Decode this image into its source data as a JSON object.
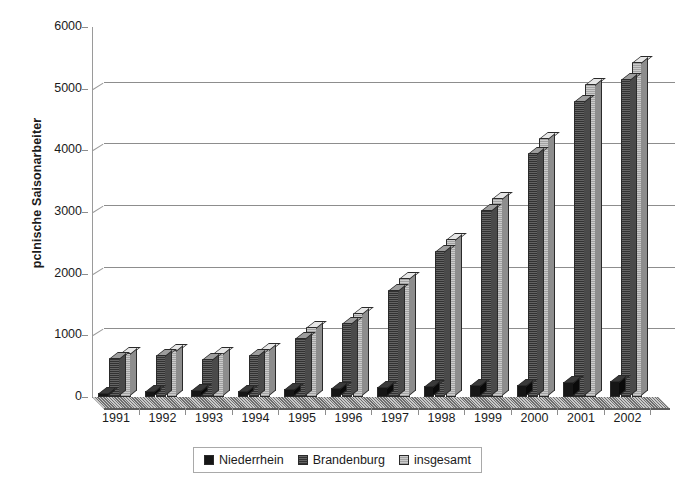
{
  "chart_data": {
    "type": "bar",
    "title": "",
    "xlabel": "",
    "ylabel": "pclnische Saisonarbeiter",
    "ylim": [
      0,
      6000
    ],
    "ytick_labels": [
      "6000",
      "5000",
      "4000",
      "3000",
      "2000",
      "1000",
      "0"
    ],
    "ytick_values": [
      6000,
      5000,
      4000,
      3000,
      2000,
      1000,
      0
    ],
    "grid": true,
    "legend_position": "bottom",
    "categories": [
      "1991",
      "1992",
      "1993",
      "1994",
      "1995",
      "1996",
      "1997",
      "1998",
      "1999",
      "2000",
      "2001",
      "2002"
    ],
    "series": [
      {
        "name": "Niederrhein",
        "color": "#161616",
        "values": [
          70,
          90,
          110,
          100,
          130,
          140,
          160,
          180,
          190,
          200,
          240,
          260
        ]
      },
      {
        "name": "Brandenburg",
        "color": "#8a8a8a",
        "values": [
          640,
          680,
          610,
          680,
          960,
          1200,
          1740,
          2370,
          3030,
          3950,
          4800,
          5150
        ]
      },
      {
        "name": "insgesamt",
        "color": "#dadada",
        "values": [
          710,
          760,
          710,
          780,
          1130,
          1370,
          1930,
          2560,
          3220,
          4200,
          5080,
          5430
        ]
      }
    ]
  },
  "legend": {
    "items": [
      {
        "label": "Niederrhein",
        "swatch": "swatch-niederrhein"
      },
      {
        "label": "Brandenburg",
        "swatch": "swatch-brandenburg"
      },
      {
        "label": "insgesamt",
        "swatch": "swatch-insgesamt"
      }
    ]
  }
}
